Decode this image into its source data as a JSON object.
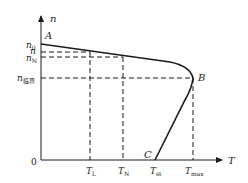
{
  "diagram": {
    "axes": {
      "y_label": "n",
      "x_label": "T",
      "origin_label": "0"
    },
    "y_ticks": [
      {
        "base": "n",
        "sub": "0",
        "y": 45
      },
      {
        "base": "n",
        "sub": "",
        "y": 52
      },
      {
        "base": "n",
        "sub": "N",
        "y": 57
      },
      {
        "base": "n",
        "sub": "临界",
        "y": 78
      }
    ],
    "x_ticks": [
      {
        "base": "T",
        "sub": "L",
        "x": 90
      },
      {
        "base": "T",
        "sub": "N",
        "x": 123
      },
      {
        "base": "T",
        "sub": "st",
        "x": 155
      },
      {
        "base": "T",
        "sub": "max",
        "x": 193
      }
    ],
    "points": {
      "A": "A",
      "B": "B",
      "C": "C"
    },
    "colors": {
      "line": "#1a1a1a",
      "text": "#222222"
    }
  }
}
